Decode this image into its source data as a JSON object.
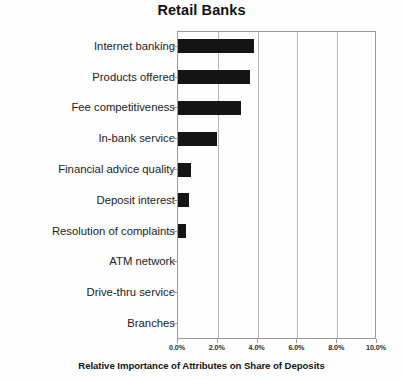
{
  "chart_data": {
    "type": "bar",
    "orientation": "horizontal",
    "title": "Retail Banks",
    "xlabel": "Relative Importance of Attributes on Share of Deposits",
    "ylabel": "",
    "categories": [
      "Internet banking",
      "Products offered",
      "Fee competitiveness",
      "In-bank service",
      "Financial advice quality",
      "Deposit interest",
      "Resolution of complaints",
      "ATM network",
      "Drive-thru service",
      "Branches"
    ],
    "values": [
      3.8,
      3.6,
      3.15,
      1.95,
      0.65,
      0.55,
      0.42,
      0.0,
      0.0,
      0.0
    ],
    "value_unit": "%",
    "xlim": [
      0,
      10
    ],
    "xticks": [
      0,
      2,
      4,
      6,
      8,
      10
    ],
    "xtick_labels": [
      "0.0%",
      "2.0%",
      "4.0%",
      "6.0%",
      "8.0%",
      "10.0%"
    ],
    "grid": true,
    "grid_axis": "x",
    "legend": false,
    "bar_color": "#141414",
    "grid_color": "#b5b5b5",
    "frame_color": "#9a9a9a",
    "background_color": "#fefefe"
  }
}
